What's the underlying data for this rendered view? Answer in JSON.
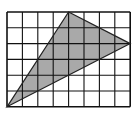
{
  "diagram": {
    "type": "grid-triangle",
    "grid": {
      "columns": 8,
      "rows": 6,
      "origin_px": [
        7,
        12
      ],
      "cell_w": 15.4,
      "cell_h": 15.8,
      "line_color": "#111111"
    },
    "triangle": {
      "vertices_grid": [
        [
          0,
          6
        ],
        [
          4,
          0
        ],
        [
          8,
          2
        ]
      ],
      "fill": "#a9a9a9",
      "stroke": "#222222"
    }
  }
}
